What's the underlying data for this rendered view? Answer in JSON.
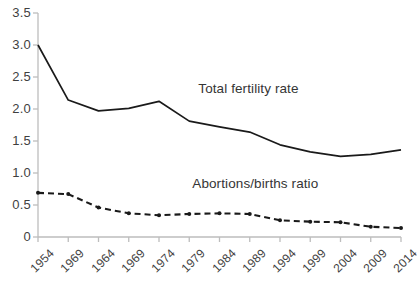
{
  "chart_data": {
    "type": "line",
    "title": "",
    "subtitle": "",
    "xlabel": "",
    "ylabel": "",
    "categories": [
      "1954",
      "1969",
      "1964",
      "1969",
      "1974",
      "1979",
      "1984",
      "1989",
      "1994",
      "1999",
      "2004",
      "2009",
      "2014"
    ],
    "x_tick_labels": [
      "1954",
      "1969",
      "1964",
      "1969",
      "1974",
      "1979",
      "1984",
      "1989",
      "1994",
      "1999",
      "2004",
      "2009",
      "2014"
    ],
    "y_tick_labels": [
      "3.5",
      "3.0",
      "2.5",
      "2.0",
      "1.5",
      "1.0",
      "0.5",
      "0"
    ],
    "y_tick_values": [
      3.5,
      3.0,
      2.5,
      2.0,
      1.5,
      1.0,
      0.5,
      0
    ],
    "ylim": [
      0,
      3.5
    ],
    "grid": false,
    "legend_position": "inline-annotation",
    "series": [
      {
        "name": "Total fertility rate",
        "style": "solid",
        "color": "#1a1a1a",
        "markers": false,
        "values": [
          3.0,
          2.14,
          1.97,
          2.01,
          2.12,
          1.81,
          1.72,
          1.64,
          1.44,
          1.33,
          1.26,
          1.29,
          1.36
        ]
      },
      {
        "name": "Abortions/births ratio",
        "style": "dashed",
        "color": "#1a1a1a",
        "markers": true,
        "values": [
          0.69,
          0.67,
          0.46,
          0.37,
          0.34,
          0.36,
          0.37,
          0.36,
          0.26,
          0.24,
          0.23,
          0.16,
          0.14
        ]
      }
    ],
    "annotations": [
      {
        "text": "Total fertility rate",
        "x_index": 5.3,
        "y_value": 2.3
      },
      {
        "text": "Abortions/births ratio",
        "x_index": 5.1,
        "y_value": 0.82
      }
    ],
    "axis_color": "#bdbdbd",
    "tick_color": "#bdbdbd",
    "background": "#ffffff"
  }
}
